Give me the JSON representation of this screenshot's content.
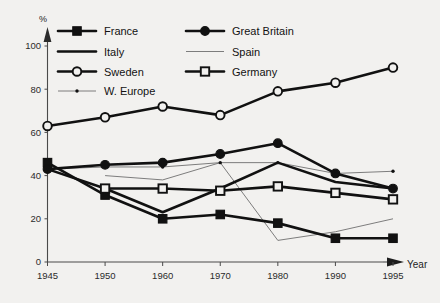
{
  "chart_data": {
    "type": "line",
    "title": "",
    "subtitle": "",
    "xlabel": "Year",
    "ylabel": "%",
    "x": [
      1945,
      1950,
      1960,
      1970,
      1980,
      1990,
      1995
    ],
    "xtick_labels": [
      "1945",
      "1950",
      "1960",
      "1970",
      "1980",
      "1990",
      "1995"
    ],
    "ytick_labels": [
      "0",
      "20",
      "40",
      "60",
      "80",
      "100"
    ],
    "yticks": [
      0,
      20,
      40,
      60,
      80,
      100
    ],
    "ylim": [
      0,
      108
    ],
    "grid": false,
    "legend_position": "top-left",
    "series": [
      {
        "name": "France",
        "marker": "filled-square",
        "line": "thick",
        "color": "#111111",
        "x": [
          1945,
          1950,
          1960,
          1970,
          1980,
          1990,
          1995
        ],
        "values": [
          46,
          31,
          20,
          22,
          18,
          11,
          11
        ]
      },
      {
        "name": "Great Britain",
        "marker": "filled-circle",
        "line": "thick",
        "color": "#111111",
        "x": [
          1945,
          1950,
          1960,
          1970,
          1980,
          1990,
          1995
        ],
        "values": [
          43,
          45,
          46,
          50,
          55,
          41,
          34
        ]
      },
      {
        "name": "Italy",
        "marker": "none",
        "line": "thick",
        "color": "#111111",
        "x": [
          1945,
          1950,
          1960,
          1970,
          1980,
          1990,
          1995
        ],
        "values": [
          43,
          34,
          23,
          34,
          46,
          37,
          34
        ]
      },
      {
        "name": "Spain",
        "marker": "none",
        "line": "thin",
        "color": "#6f6f6f",
        "x": [
          1950,
          1960,
          1970,
          1980,
          1990,
          1995
        ],
        "values": [
          40,
          38,
          46,
          10,
          14,
          20
        ]
      },
      {
        "name": "Sweden",
        "marker": "open-circle",
        "line": "thick",
        "color": "#111111",
        "x": [
          1945,
          1950,
          1960,
          1970,
          1980,
          1990,
          1995
        ],
        "values": [
          63,
          67,
          72,
          68,
          79,
          83,
          90
        ]
      },
      {
        "name": "Germany",
        "marker": "open-square",
        "line": "thick",
        "color": "#111111",
        "x": [
          1950,
          1960,
          1970,
          1980,
          1990,
          1995
        ],
        "values": [
          34,
          34,
          33,
          35,
          32,
          29
        ]
      },
      {
        "name": "W. Europe",
        "marker": "small-dot",
        "line": "thin",
        "color": "#6f6f6f",
        "x": [
          1945,
          1950,
          1960,
          1970,
          1980,
          1990,
          1995
        ],
        "values": [
          43,
          44,
          44,
          46,
          46,
          41,
          42
        ]
      }
    ]
  },
  "legend": {
    "entries": [
      {
        "label": "France",
        "marker": "filled-square",
        "line": "thick",
        "col": 0,
        "row": 0
      },
      {
        "label": "Great Britain",
        "marker": "filled-circle",
        "line": "thick",
        "col": 1,
        "row": 0
      },
      {
        "label": "Italy",
        "marker": "none",
        "line": "thick",
        "col": 0,
        "row": 1
      },
      {
        "label": "Spain",
        "marker": "none",
        "line": "thin",
        "col": 1,
        "row": 1
      },
      {
        "label": "Sweden",
        "marker": "open-circle",
        "line": "thick",
        "col": 0,
        "row": 2
      },
      {
        "label": "Germany",
        "marker": "open-square",
        "line": "thick",
        "col": 1,
        "row": 2
      },
      {
        "label": "W. Europe",
        "marker": "small-dot",
        "line": "thin",
        "col": 0,
        "row": 3
      }
    ]
  },
  "axes": {
    "y_unit_label": "%",
    "x_axis_label": "Year"
  }
}
